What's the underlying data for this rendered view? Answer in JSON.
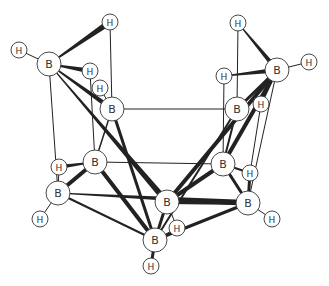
{
  "diagram": {
    "title": "",
    "colors": {
      "line": "#222222",
      "atom_fill": "#ffffff",
      "atom_stroke": "#333333",
      "label": "#333333"
    },
    "atoms": [
      {
        "id": "B1",
        "el": "B",
        "x": 49,
        "y": 64,
        "r": 12
      },
      {
        "id": "B2",
        "el": "B",
        "x": 112,
        "y": 109,
        "r": 12
      },
      {
        "id": "B3",
        "el": "B",
        "x": 95,
        "y": 162,
        "r": 12
      },
      {
        "id": "B4",
        "el": "B",
        "x": 58,
        "y": 193,
        "r": 12
      },
      {
        "id": "B5",
        "el": "B",
        "x": 167,
        "y": 202,
        "r": 12
      },
      {
        "id": "B6",
        "el": "B",
        "x": 155,
        "y": 240,
        "r": 12
      },
      {
        "id": "B7",
        "el": "B",
        "x": 277,
        "y": 70,
        "r": 12
      },
      {
        "id": "B8",
        "el": "B",
        "x": 237,
        "y": 109,
        "r": 12
      },
      {
        "id": "B9",
        "el": "B",
        "x": 223,
        "y": 164,
        "r": 12
      },
      {
        "id": "B10",
        "el": "B",
        "x": 248,
        "y": 203,
        "r": 12
      },
      {
        "id": "H1",
        "el": "H",
        "x": 19,
        "y": 50,
        "r": 8
      },
      {
        "id": "H2",
        "el": "H",
        "x": 110,
        "y": 22,
        "r": 8
      },
      {
        "id": "H3",
        "el": "H",
        "x": 90,
        "y": 71,
        "r": 8
      },
      {
        "id": "H4",
        "el": "H",
        "x": 100,
        "y": 88,
        "r": 8
      },
      {
        "id": "H5",
        "el": "H",
        "x": 59,
        "y": 167,
        "r": 8
      },
      {
        "id": "H6",
        "el": "H",
        "x": 40,
        "y": 219,
        "r": 8
      },
      {
        "id": "H7",
        "el": "H",
        "x": 177,
        "y": 228,
        "r": 8
      },
      {
        "id": "H8",
        "el": "H",
        "x": 151,
        "y": 266,
        "r": 8
      },
      {
        "id": "H9",
        "el": "H",
        "x": 238,
        "y": 23,
        "r": 8
      },
      {
        "id": "H10",
        "el": "H",
        "x": 309,
        "y": 62,
        "r": 8
      },
      {
        "id": "H11",
        "el": "H",
        "x": 224,
        "y": 76,
        "r": 8
      },
      {
        "id": "H12",
        "el": "H",
        "x": 261,
        "y": 104,
        "r": 8
      },
      {
        "id": "H13",
        "el": "H",
        "x": 250,
        "y": 173,
        "r": 8
      },
      {
        "id": "H14",
        "el": "H",
        "x": 272,
        "y": 219,
        "r": 8
      }
    ],
    "bonds": [
      {
        "a": "H1",
        "b": "B1",
        "w": 1
      },
      {
        "a": "B1",
        "b": "H2",
        "w": 5,
        "wedge": true
      },
      {
        "a": "B1",
        "b": "H3",
        "w": 4,
        "wedge": true
      },
      {
        "a": "B1",
        "b": "B2",
        "w": 4,
        "wedge": true
      },
      {
        "a": "B1",
        "b": "B4",
        "w": 1
      },
      {
        "a": "B1",
        "b": "B5",
        "w": 5,
        "wedge": true
      },
      {
        "a": "H2",
        "b": "B2",
        "w": 1
      },
      {
        "a": "H3",
        "b": "B3",
        "w": 1
      },
      {
        "a": "H4",
        "b": "B2",
        "w": 1
      },
      {
        "a": "B2",
        "b": "B8",
        "w": 1
      },
      {
        "a": "B2",
        "b": "B3",
        "w": 1.5
      },
      {
        "a": "B2",
        "b": "B6",
        "w": 3
      },
      {
        "a": "B3",
        "b": "B9",
        "w": 1
      },
      {
        "a": "B3",
        "b": "H5",
        "w": 3,
        "wedge": true
      },
      {
        "a": "B3",
        "b": "B4",
        "w": 4
      },
      {
        "a": "B3",
        "b": "B6",
        "w": 4
      },
      {
        "a": "H5",
        "b": "B4",
        "w": 1
      },
      {
        "a": "B4",
        "b": "H6",
        "w": 1
      },
      {
        "a": "B4",
        "b": "B10",
        "w": 5,
        "wedge": true
      },
      {
        "a": "B4",
        "b": "B6",
        "w": 2
      },
      {
        "a": "B6",
        "b": "H8",
        "w": 3
      },
      {
        "a": "B6",
        "b": "H7",
        "w": 1
      },
      {
        "a": "B6",
        "b": "B10",
        "w": 3
      },
      {
        "a": "B5",
        "b": "H7",
        "w": 1
      },
      {
        "a": "B5",
        "b": "B9",
        "w": 4
      },
      {
        "a": "B5",
        "b": "B6",
        "w": 3
      },
      {
        "a": "B5",
        "b": "B10",
        "w": 4
      },
      {
        "a": "B5",
        "b": "B7",
        "w": 4
      },
      {
        "a": "B6",
        "b": "B8",
        "w": 2
      },
      {
        "a": "H9",
        "b": "B7",
        "w": 4,
        "wedge": true
      },
      {
        "a": "B7",
        "b": "H10",
        "w": 1
      },
      {
        "a": "H11",
        "b": "B7",
        "w": 4,
        "wedge": true
      },
      {
        "a": "H9",
        "b": "B8",
        "w": 1
      },
      {
        "a": "B7",
        "b": "B8",
        "w": 3
      },
      {
        "a": "B7",
        "b": "B9",
        "w": 4
      },
      {
        "a": "B7",
        "b": "H12",
        "w": 2
      },
      {
        "a": "B7",
        "b": "B10",
        "w": 1
      },
      {
        "a": "H11",
        "b": "B9",
        "w": 1
      },
      {
        "a": "B8",
        "b": "B9",
        "w": 2
      },
      {
        "a": "H12",
        "b": "H13",
        "w": 1
      },
      {
        "a": "B9",
        "b": "H13",
        "w": 2
      },
      {
        "a": "B9",
        "b": "B10",
        "w": 3
      },
      {
        "a": "H13",
        "b": "B10",
        "w": 3
      },
      {
        "a": "B10",
        "b": "H14",
        "w": 1
      }
    ]
  }
}
